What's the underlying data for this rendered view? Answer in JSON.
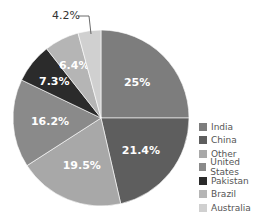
{
  "chart_data": {
    "type": "pie",
    "title": "",
    "categories": [
      "India",
      "China",
      "Other",
      "United States",
      "Pakistan",
      "Brazil",
      "Australia"
    ],
    "values": [
      25,
      21.4,
      19.5,
      16.2,
      7.3,
      6.4,
      4.2
    ],
    "labels": [
      "25%",
      "21.4%",
      "19.5%",
      "16.2%",
      "7.3%",
      "6.4%",
      "4.2%"
    ],
    "colors": [
      "#7d7d7d",
      "#5e5e5e",
      "#a8a8a8",
      "#8a8a8a",
      "#2b2b2b",
      "#b5b5b5",
      "#d0d0d0"
    ],
    "start_angle_deg": 0,
    "direction": "clockwise",
    "legend_position": "right"
  },
  "legend": {
    "items": [
      {
        "label": "India",
        "color": "#7d7d7d"
      },
      {
        "label": "China",
        "color": "#5e5e5e"
      },
      {
        "label": "Other",
        "color": "#a8a8a8"
      },
      {
        "label": "United States",
        "color": "#8a8a8a"
      },
      {
        "label": "Pakistan",
        "color": "#2b2b2b"
      },
      {
        "label": "Brazil",
        "color": "#b5b5b5"
      },
      {
        "label": "Australia",
        "color": "#d0d0d0"
      }
    ]
  },
  "callout": {
    "label": "4.2%"
  }
}
